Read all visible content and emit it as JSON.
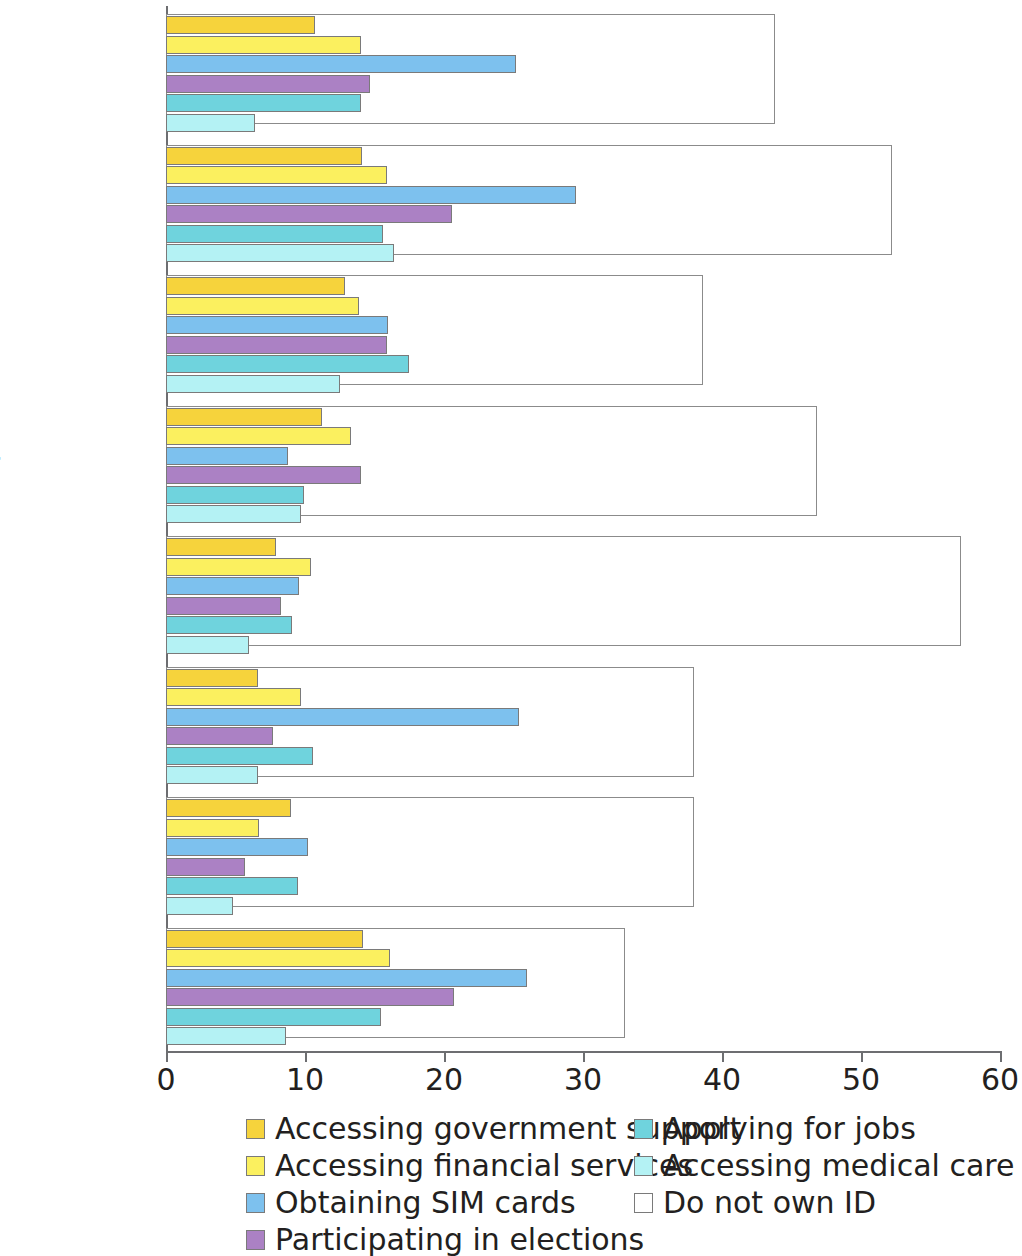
{
  "chart_data": {
    "type": "bar",
    "orientation": "horizontal",
    "title": "",
    "subtitle": "",
    "xlabel": "",
    "ylabel": "",
    "xlim": [
      0,
      60
    ],
    "xticks": [
      0,
      10,
      20,
      30,
      40,
      50,
      60
    ],
    "xtick_labels": [
      "0",
      "10",
      "20",
      "30",
      "40",
      "50",
      "60"
    ],
    "grid": false,
    "legend_position": "bottom",
    "categories": [
      "Congo, Rep.",
      "Guinea",
      "Mozambique",
      "Niger",
      "Sierra Leone",
      "Tanzania",
      "Togo",
      "Uganda"
    ],
    "series": [
      {
        "name": "Accessing government support",
        "color": "#f6d33c",
        "values": [
          10.7,
          14.1,
          12.9,
          11.2,
          7.9,
          6.6,
          9.0,
          14.2
        ]
      },
      {
        "name": "Accessing financial services",
        "color": "#fbf05f",
        "values": [
          14.0,
          15.9,
          13.9,
          13.3,
          10.4,
          9.7,
          6.7,
          16.1
        ]
      },
      {
        "name": "Obtaining SIM cards",
        "color": "#7dc1ee",
        "values": [
          25.2,
          29.5,
          16.0,
          8.8,
          9.6,
          25.4,
          10.2,
          26.0
        ]
      },
      {
        "name": "Participating in elections",
        "color": "#ab81c4",
        "values": [
          14.7,
          20.6,
          15.9,
          14.0,
          8.3,
          7.7,
          5.7,
          20.7
        ]
      },
      {
        "name": "Applying for jobs",
        "color": "#6fd3dd",
        "values": [
          14.0,
          15.6,
          17.5,
          9.9,
          9.1,
          10.6,
          9.5,
          15.5
        ]
      },
      {
        "name": "Accessing medical care",
        "color": "#b4f2f4",
        "values": [
          6.4,
          16.4,
          12.5,
          9.7,
          6.0,
          6.6,
          4.8,
          8.6
        ]
      },
      {
        "name": "Do not own ID",
        "color": "#ffffff",
        "values": [
          43.8,
          52.2,
          38.6,
          46.8,
          57.2,
          38.0,
          38.0,
          33.0
        ]
      }
    ]
  },
  "legend": {
    "items": [
      {
        "label": "Accessing government support",
        "color": "#f6d33c"
      },
      {
        "label": "Accessing financial services",
        "color": "#fbf05f"
      },
      {
        "label": "Obtaining SIM cards",
        "color": "#7dc1ee"
      },
      {
        "label": "Participating in elections",
        "color": "#ab81c4"
      },
      {
        "label": "Applying for jobs",
        "color": "#6fd3dd"
      },
      {
        "label": "Accessing medical care",
        "color": "#b4f2f4"
      },
      {
        "label": "Do not own ID",
        "color": "#ffffff"
      }
    ]
  }
}
